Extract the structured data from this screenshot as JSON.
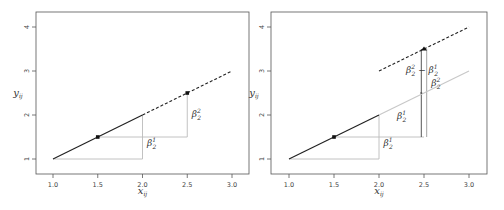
{
  "chart_data": [
    {
      "type": "line",
      "panel": "left",
      "xlabel": "x_ij",
      "ylabel": "y_ij",
      "xlim": [
        0.8,
        3.2
      ],
      "ylim": [
        0.5,
        4.3
      ],
      "xticks": [
        "1.0",
        "1.5",
        "2.0",
        "2.5",
        "3.0"
      ],
      "yticks": [
        "1",
        "2",
        "3",
        "4"
      ],
      "grid": false,
      "series": [
        {
          "name": "segment-1",
          "style": "solid",
          "color": "#222222",
          "x": [
            1.0,
            2.0
          ],
          "y": [
            1.0,
            2.0
          ]
        },
        {
          "name": "segment-2",
          "style": "dashed",
          "color": "#222222",
          "x": [
            2.0,
            3.0
          ],
          "y": [
            2.0,
            3.0
          ]
        }
      ],
      "points": [
        {
          "x": 1.5,
          "y": 1.5,
          "marker": "square"
        },
        {
          "x": 2.5,
          "y": 2.5,
          "marker": "square"
        }
      ],
      "guides": [
        {
          "x": [
            1.0,
            2.0
          ],
          "y": [
            1.0,
            1.0
          ]
        },
        {
          "x": [
            2.0,
            2.0
          ],
          "y": [
            1.0,
            2.0
          ]
        },
        {
          "x": [
            1.5,
            2.5
          ],
          "y": [
            1.5,
            1.5
          ]
        },
        {
          "x": [
            2.5,
            2.5
          ],
          "y": [
            1.5,
            2.5
          ]
        }
      ],
      "annotations": [
        {
          "text": "β",
          "sup": "1",
          "sub": "2",
          "x": 2.05,
          "y": 1.3
        },
        {
          "text": "β",
          "sup": "2",
          "sub": "2",
          "x": 2.55,
          "y": 1.95
        }
      ]
    },
    {
      "type": "line",
      "panel": "right",
      "xlabel": "x_ij",
      "ylabel": "y_ij",
      "xlim": [
        0.8,
        3.2
      ],
      "ylim": [
        0.5,
        4.3
      ],
      "xticks": [
        "1.0",
        "1.5",
        "2.0",
        "2.5",
        "3.0"
      ],
      "yticks": [
        "1",
        "2",
        "3",
        "4"
      ],
      "grid": false,
      "series": [
        {
          "name": "segment-1",
          "style": "solid",
          "color": "#222222",
          "x": [
            1.0,
            2.0
          ],
          "y": [
            1.0,
            2.0
          ]
        },
        {
          "name": "segment-2-gray",
          "style": "solid",
          "color": "#c8c8c8",
          "x": [
            2.0,
            3.0
          ],
          "y": [
            2.0,
            3.0
          ]
        },
        {
          "name": "segment-2-shifted",
          "style": "dashed",
          "color": "#222222",
          "x": [
            2.0,
            3.0
          ],
          "y": [
            3.0,
            4.0
          ]
        }
      ],
      "points": [
        {
          "x": 1.5,
          "y": 1.5,
          "marker": "square"
        },
        {
          "x": 2.47,
          "y": 2.5,
          "marker": "small"
        },
        {
          "x": 2.5,
          "y": 3.5,
          "marker": "triangle"
        }
      ],
      "guides": [
        {
          "x": [
            1.0,
            2.0
          ],
          "y": [
            1.0,
            1.0
          ],
          "color": "#bbbbbb"
        },
        {
          "x": [
            2.0,
            2.0
          ],
          "y": [
            1.0,
            2.0
          ],
          "color": "#bbbbbb"
        },
        {
          "x": [
            1.5,
            2.5
          ],
          "y": [
            1.5,
            1.5
          ],
          "color": "#bbbbbb"
        },
        {
          "x": [
            2.47,
            2.47
          ],
          "y": [
            1.5,
            3.5
          ],
          "color": "#444444"
        },
        {
          "x": [
            2.53,
            2.53
          ],
          "y": [
            1.5,
            3.5
          ],
          "color": "#999999"
        }
      ],
      "annotations": [
        {
          "text": "β",
          "sup": "1",
          "sub": "2",
          "x": 2.05,
          "y": 1.3
        },
        {
          "text": "β",
          "sup": "1",
          "sub": "2",
          "x": 2.2,
          "y": 1.9
        },
        {
          "text": "β",
          "sup": "2",
          "sub": "2",
          "x": 2.58,
          "y": 2.65
        },
        {
          "text": "β²₂ − β¹₂",
          "x": 2.3,
          "y": 2.95,
          "compound": true
        }
      ]
    }
  ]
}
